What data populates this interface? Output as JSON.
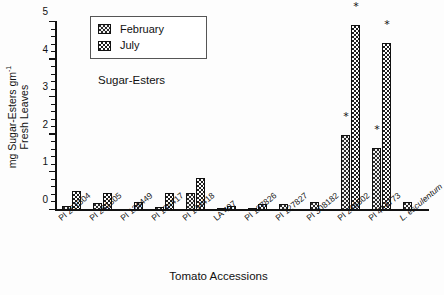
{
  "chart_data": {
    "type": "bar",
    "title": "",
    "annotation": "Sugar-Esters",
    "xlabel": "Tomato Accessions",
    "ylabel_line1": "mg Sugar-Esters gm",
    "ylabel_sup": "-1",
    "ylabel_line2": "Fresh Leaves",
    "ylim": [
      0,
      5
    ],
    "yticks": [
      0,
      1,
      2,
      3,
      4,
      5
    ],
    "yminor_step": 0.2,
    "grid": false,
    "legend_position": "top-left-inside",
    "categories": [
      "PI 251304",
      "PI 251305",
      "PI 126449",
      "PI 134417",
      "PI 134418",
      "LA 407",
      "PI 127826",
      "PI 127827",
      "PI 308182",
      "PI 246502",
      "PI 414773",
      "L. esculentum"
    ],
    "categories_italic": [
      false,
      false,
      false,
      false,
      false,
      false,
      false,
      false,
      false,
      false,
      false,
      true
    ],
    "series": [
      {
        "name": "February",
        "color": "#2b2b2b",
        "pattern": "dark-checkerboard",
        "values": [
          0.1,
          0.18,
          0.0,
          0.08,
          0.45,
          0.04,
          0.03,
          0.15,
          0.2,
          2.0,
          1.65,
          0.2
        ],
        "significance": [
          "",
          "",
          "",
          "",
          "",
          "",
          "",
          "",
          "",
          "*",
          "*",
          ""
        ]
      },
      {
        "name": "July",
        "color": "#ffffff",
        "pattern": "light-checkerboard",
        "values": [
          0.5,
          0.45,
          0.2,
          0.46,
          0.85,
          0.1,
          0.15,
          0.0,
          0.0,
          4.93,
          4.45,
          0.0
        ],
        "significance": [
          "",
          "",
          "",
          "",
          "",
          "",
          "",
          "",
          "",
          "*",
          "*",
          ""
        ]
      }
    ]
  },
  "legend": {
    "items": [
      {
        "label": "February",
        "swatch": "feb"
      },
      {
        "label": "July",
        "swatch": "jul"
      }
    ]
  }
}
